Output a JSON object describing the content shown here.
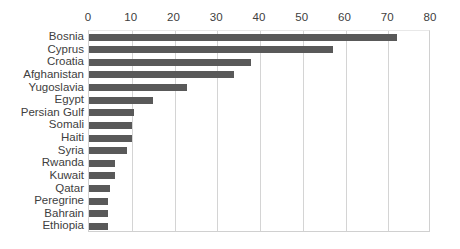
{
  "chart_data": {
    "type": "bar",
    "orientation": "horizontal",
    "title": "",
    "subtitle": "",
    "xlabel": "",
    "ylabel": "",
    "xlim": [
      0,
      80
    ],
    "ylim": null,
    "grid": true,
    "legend": false,
    "legend_position": "none",
    "xticks": [
      0,
      10,
      20,
      30,
      40,
      50,
      60,
      70,
      80
    ],
    "xtick_labels": [
      "0",
      "10",
      "20",
      "30",
      "40",
      "50",
      "60",
      "70",
      "80"
    ],
    "xaxis_position": "top",
    "categories": [
      "Bosnia",
      "Cyprus",
      "Croatia",
      "Afghanistan",
      "Yugoslavia",
      "Egypt",
      "Persian Gulf",
      "Somali",
      "Haiti",
      "Syria",
      "Rwanda",
      "Kuwait",
      "Qatar",
      "Peregrine",
      "Bahrain",
      "Ethiopia"
    ],
    "values": [
      72,
      57,
      38,
      34,
      23,
      15,
      10.5,
      10,
      10,
      9,
      6,
      6,
      5,
      4.5,
      4.5,
      4.5
    ],
    "series": [
      {
        "name": "",
        "values": [
          72,
          57,
          38,
          34,
          23,
          15,
          10.5,
          10,
          10,
          9,
          6,
          6,
          5,
          4.5,
          4.5,
          4.5
        ]
      }
    ],
    "colors": {
      "bar": "#595959",
      "gridline": "#d4d4d4",
      "axis": "#d0d0d0",
      "text": "#404040",
      "background": "#ffffff"
    }
  }
}
